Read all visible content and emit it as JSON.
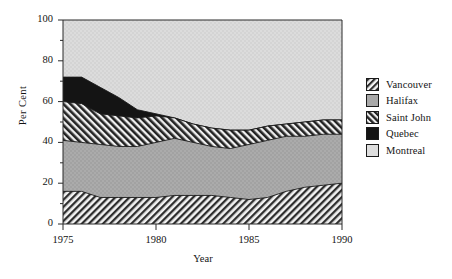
{
  "chart_data": {
    "type": "area",
    "title": "",
    "subtitle": "",
    "xlabel": "Year",
    "ylabel": "Per Cent",
    "xlim": [
      1975,
      1990
    ],
    "ylim": [
      0,
      100
    ],
    "xticks": [
      1975,
      1980,
      1985,
      1990
    ],
    "yticks": [
      0,
      20,
      40,
      60,
      80,
      100
    ],
    "yminorticks": [
      10,
      30,
      50,
      70,
      90
    ],
    "grid": false,
    "stacked": true,
    "stack_order_bottom_to_top": [
      "Vancouver",
      "Halifax",
      "Saint John",
      "Quebec",
      "Montreal"
    ],
    "legend_position": "right",
    "x": [
      1975,
      1976,
      1977,
      1978,
      1979,
      1980,
      1981,
      1982,
      1983,
      1984,
      1985,
      1986,
      1987,
      1988,
      1989,
      1990
    ],
    "series": [
      {
        "name": "Vancouver",
        "pattern": "diagonal-hatch",
        "color": "#3a3a3a",
        "values": [
          16,
          16,
          13,
          13,
          13,
          13,
          14,
          14,
          14,
          13,
          12,
          13,
          16,
          18,
          19,
          20
        ]
      },
      {
        "name": "Halifax",
        "pattern": "solid-gray",
        "color": "#a9a9a9",
        "values": [
          25,
          24,
          26,
          25,
          25,
          27,
          28,
          26,
          24,
          24,
          27,
          28,
          27,
          25,
          25,
          24
        ]
      },
      {
        "name": "Saint John",
        "pattern": "bold-diagonal-hatch",
        "color": "#2b2b2b",
        "values": [
          19,
          19,
          15,
          15,
          14,
          13,
          10,
          9,
          9,
          9,
          7,
          7,
          6,
          7,
          7,
          7
        ]
      },
      {
        "name": "Quebec",
        "pattern": "solid-black",
        "color": "#111111",
        "values": [
          12,
          13,
          13,
          9,
          4,
          1,
          0,
          0,
          0,
          0,
          0,
          0,
          0,
          0,
          0,
          0
        ]
      },
      {
        "name": "Montreal",
        "pattern": "light-gray",
        "color": "#d8d8d8",
        "values": [
          28,
          28,
          33,
          38,
          44,
          46,
          48,
          51,
          53,
          54,
          54,
          52,
          51,
          50,
          49,
          49
        ]
      }
    ],
    "cumulative_tops": {
      "Vancouver": [
        16,
        16,
        13,
        13,
        13,
        13,
        14,
        14,
        14,
        13,
        12,
        13,
        16,
        18,
        19,
        20
      ],
      "Halifax": [
        41,
        40,
        39,
        38,
        38,
        40,
        42,
        40,
        38,
        37,
        39,
        41,
        43,
        43,
        44,
        44
      ],
      "Saint John": [
        60,
        59,
        54,
        53,
        52,
        53,
        52,
        49,
        47,
        46,
        46,
        48,
        49,
        50,
        51,
        51
      ],
      "Quebec": [
        72,
        72,
        67,
        62,
        56,
        54,
        52,
        49,
        47,
        46,
        46,
        48,
        49,
        50,
        51,
        51
      ],
      "Montreal": [
        100,
        100,
        100,
        100,
        100,
        100,
        100,
        100,
        100,
        100,
        100,
        100,
        100,
        100,
        100,
        100
      ]
    }
  },
  "axes": {
    "ylabel": "Per Cent",
    "xlabel": "Year",
    "ytick_labels": [
      "0",
      "20",
      "40",
      "60",
      "80",
      "100"
    ],
    "xtick_labels": [
      "1975",
      "1980",
      "1985",
      "1990"
    ]
  },
  "legend": {
    "items": [
      {
        "label": "Vancouver",
        "pattern": "diagonal-hatch"
      },
      {
        "label": "Halifax",
        "pattern": "solid-gray"
      },
      {
        "label": "Saint John",
        "pattern": "bold-diagonal-hatch"
      },
      {
        "label": "Quebec",
        "pattern": "solid-black"
      },
      {
        "label": "Montreal",
        "pattern": "light-gray"
      }
    ]
  }
}
